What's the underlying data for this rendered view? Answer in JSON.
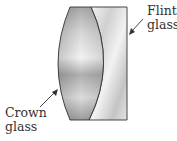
{
  "diagram": {
    "type": "achromatic doublet lens",
    "labels": {
      "flint": {
        "line1": "Flint",
        "line2": "glass"
      },
      "crown": {
        "line1": "Crown",
        "line2": "glass"
      }
    },
    "colors": {
      "outline": "#333333",
      "glass_dark": "#9a9a9a",
      "glass_light": "#f4f4f4",
      "text": "#333333",
      "background": "#ffffff"
    }
  }
}
